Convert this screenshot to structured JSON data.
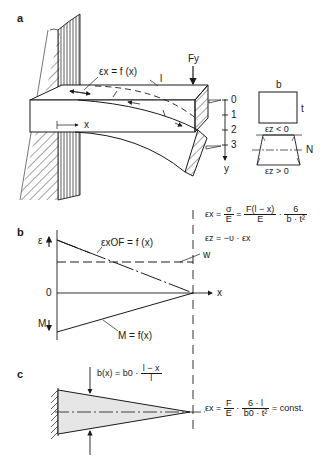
{
  "panels": {
    "a": {
      "label": "a",
      "strain_label": "εx = f (x)",
      "length_label": "l",
      "force_label": "Fy",
      "x_axis_label": "x",
      "y_axis_label": "y",
      "y_ticks": [
        "0",
        "1",
        "2",
        "3"
      ],
      "cross_section": {
        "width_label": "b",
        "thickness_label": "t",
        "compression_label": "εz < 0",
        "neutral_label": "N",
        "tension_label": "εz > 0"
      }
    },
    "b": {
      "label": "b",
      "epsilon_axis_label": "ε",
      "moment_axis_label": "M",
      "origin_label": "0",
      "x_axis_label": "x",
      "strain_curve_label": "εxOF = f (x)",
      "moment_curve_label": "M = f(x)",
      "w_label": "w",
      "formula_line1": {
        "lhs": "εx =",
        "f1_num": "σ",
        "f1_den": "E",
        "eq": "=",
        "f2_num": "F(l − x)",
        "f2_den": "E",
        "dot": "·",
        "f3_num": "6",
        "f3_den": "b · t²"
      },
      "formula_line2": "εz = −υ · εx"
    },
    "c": {
      "label": "c",
      "width_formula": {
        "lhs": "b(x) = b0 ·",
        "num": "l − x",
        "den": "l"
      },
      "strain_formula": {
        "lhs": "εx =",
        "f1_num": "F",
        "f1_den": "E",
        "dot": "·",
        "f2_num": "6 · l",
        "f2_den": "b0 · t²",
        "rhs": "= const."
      }
    }
  },
  "colors": {
    "ink": "#1a1a1a",
    "fill_shaded": "#e6e6e6",
    "background": "#ffffff"
  }
}
